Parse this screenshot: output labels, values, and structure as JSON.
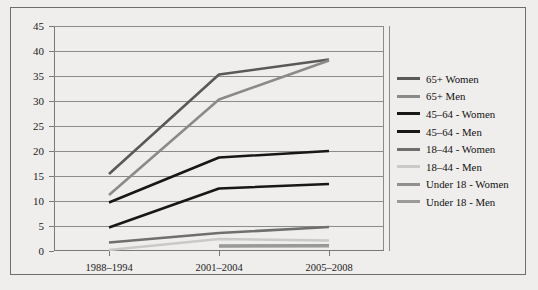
{
  "chart_data": {
    "type": "line",
    "title": "",
    "xlabel": "",
    "ylabel": "",
    "categories": [
      "1988–1994",
      "2001–2004",
      "2005–2008"
    ],
    "ylim": [
      0,
      45
    ],
    "ytick_step": 5,
    "yticks": [
      "0",
      "5",
      "10",
      "15",
      "20",
      "25",
      "30",
      "35",
      "40",
      "45"
    ],
    "grid": true,
    "legend_position": "right",
    "series": [
      {
        "name": "65+ Women",
        "values": [
          15.4,
          35.3,
          38.3
        ],
        "color": "#595959",
        "width": 2.6
      },
      {
        "name": "65+ Men",
        "values": [
          11.2,
          30.3,
          38.1
        ],
        "color": "#8a8a8a",
        "width": 2.6
      },
      {
        "name": "45–64 - Women",
        "values": [
          9.7,
          18.7,
          20.0
        ],
        "color": "#171717",
        "width": 2.6
      },
      {
        "name": "45–64 - Men",
        "values": [
          4.7,
          12.5,
          13.4
        ],
        "color": "#171717",
        "width": 2.6
      },
      {
        "name": "18–44 - Women",
        "values": [
          1.7,
          3.6,
          4.8
        ],
        "color": "#6f6f6f",
        "width": 2.6
      },
      {
        "name": "18–44 - Men",
        "values": [
          0.2,
          2.4,
          2.1
        ],
        "color": "#c9c9c9",
        "width": 2.6
      },
      {
        "name": "Under 18 - Women",
        "values": [
          null,
          1.0,
          1.1
        ],
        "color": "#8f8f8f",
        "width": 3.0
      },
      {
        "name": "Under 18 - Men",
        "values": [
          null,
          1.0,
          1.0
        ],
        "color": "#9a9a9a",
        "width": 3.0
      }
    ]
  }
}
